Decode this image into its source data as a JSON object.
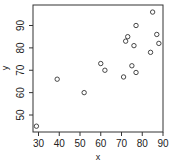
{
  "chart_data": {
    "type": "scatter",
    "title": "",
    "xlabel": "x",
    "ylabel": "y",
    "xlim": [
      28,
      90
    ],
    "ylim": [
      42,
      98
    ],
    "xticks": [
      30,
      40,
      50,
      60,
      70,
      80,
      90
    ],
    "yticks": [
      50,
      60,
      70,
      80,
      90
    ],
    "grid": false,
    "legend": null,
    "marker": "open-circle",
    "points": [
      {
        "x": 29,
        "y": 45
      },
      {
        "x": 39,
        "y": 66
      },
      {
        "x": 52,
        "y": 60
      },
      {
        "x": 60,
        "y": 73
      },
      {
        "x": 62,
        "y": 70
      },
      {
        "x": 71,
        "y": 67
      },
      {
        "x": 72,
        "y": 83
      },
      {
        "x": 73,
        "y": 85
      },
      {
        "x": 75,
        "y": 72
      },
      {
        "x": 76,
        "y": 81
      },
      {
        "x": 77,
        "y": 90
      },
      {
        "x": 77,
        "y": 69
      },
      {
        "x": 84,
        "y": 78
      },
      {
        "x": 85,
        "y": 96
      },
      {
        "x": 87,
        "y": 86
      },
      {
        "x": 88,
        "y": 82
      }
    ]
  }
}
